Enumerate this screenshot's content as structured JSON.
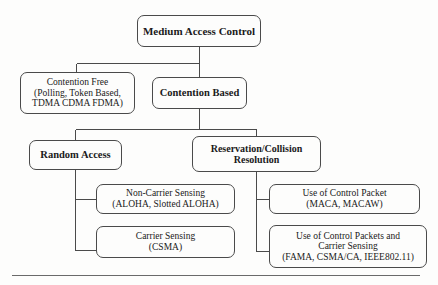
{
  "diagram": {
    "line_color": "#4a4a4a",
    "background": "#fdfdfc",
    "nodes": {
      "mac": {
        "lines": [
          "Medium Access Control"
        ],
        "emphasis": "bold"
      },
      "cf": {
        "lines": [
          "Contention Free",
          "(Polling, Token Based,",
          "TDMA CDMA FDMA)"
        ],
        "emphasis": "normal"
      },
      "cb": {
        "lines": [
          "Contention Based"
        ],
        "emphasis": "bold"
      },
      "ra": {
        "lines": [
          "Random Access"
        ],
        "emphasis": "bold"
      },
      "rcr": {
        "lines": [
          "Reservation/Collision",
          "Resolution"
        ],
        "emphasis": "bold"
      },
      "ncs": {
        "lines": [
          "Non-Carrier Sensing",
          "(ALOHA, Slotted ALOHA)"
        ],
        "emphasis": "normal"
      },
      "cs": {
        "lines": [
          "Carrier Sensing",
          "(CSMA)"
        ],
        "emphasis": "normal"
      },
      "ucp": {
        "lines": [
          "Use of Control Packet",
          "(MACA, MACAW)"
        ],
        "emphasis": "normal"
      },
      "ucpcs": {
        "lines": [
          "Use of Control Packets and",
          "Carrier Sensing",
          "(FAMA, CSMA/CA, IEEE802.11)"
        ],
        "emphasis": "normal"
      }
    }
  }
}
